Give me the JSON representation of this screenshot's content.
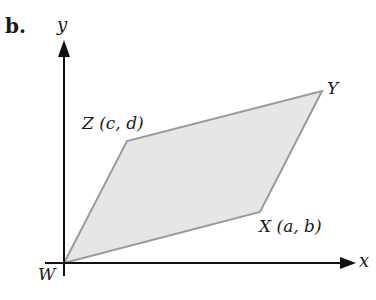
{
  "figure": {
    "panel_label": "b.",
    "axes": {
      "x_label": "x",
      "y_label": "y"
    },
    "vertices": {
      "W": {
        "label": "W",
        "x": 64,
        "y": 263
      },
      "X": {
        "label": "X (a, b)",
        "x": 260,
        "y": 212
      },
      "Y": {
        "label": "Y",
        "x": 322,
        "y": 91
      },
      "Z": {
        "label": "Z (c, d)",
        "x": 127,
        "y": 141
      }
    },
    "colors": {
      "fill": "#e6e6e6",
      "edge": "#9a9a9a",
      "axis": "#111111"
    }
  }
}
